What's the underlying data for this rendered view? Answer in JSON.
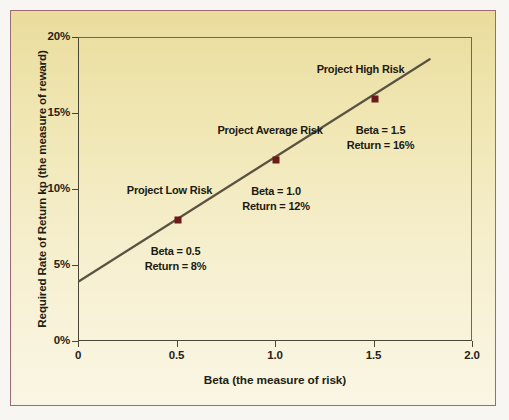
{
  "chart_data": {
    "type": "line",
    "title": "",
    "xlabel": "Beta (the measure of risk)",
    "ylabel": "Required Rate of Return kp (the measure of reward)",
    "xlim": [
      0,
      2.0
    ],
    "ylim": [
      0,
      20
    ],
    "grid": false,
    "legend": "none",
    "xticks": [
      "0",
      "0.5",
      "1.0",
      "1.5",
      "2.0"
    ],
    "xtick_values": [
      0,
      0.5,
      1.0,
      1.5,
      2.0
    ],
    "yticks": [
      "0%",
      "5%",
      "10%",
      "15%",
      "20%"
    ],
    "ytick_values": [
      0,
      5,
      10,
      15,
      20
    ],
    "series": [
      {
        "name": "Security Market Line",
        "color": "#5a5342",
        "line_x": [
          0.0,
          1.78
        ],
        "line_y": [
          4.0,
          18.6
        ]
      }
    ],
    "points": [
      {
        "name": "Project Low Risk",
        "beta": 0.5,
        "return": 8,
        "beta_label": "Beta = 0.5",
        "return_label": "Return = 8%",
        "marker_color": "#6d1a1a"
      },
      {
        "name": "Project Average Risk",
        "beta": 1.0,
        "return": 12,
        "beta_label": "Beta = 1.0",
        "return_label": "Return = 12%",
        "marker_color": "#6d1a1a"
      },
      {
        "name": "Project High Risk",
        "beta": 1.5,
        "return": 16,
        "beta_label": "Beta = 1.5",
        "return_label": "Return = 16%",
        "marker_color": "#6d1a1a"
      }
    ]
  },
  "colors": {
    "background_top": "#e9dc9c",
    "background_bottom": "#faf6e4",
    "frame_border": "#9c6a72",
    "axis": "#4a4637",
    "line": "#5a5342",
    "marker": "#6d1a1a",
    "text": "#1d1a11"
  }
}
